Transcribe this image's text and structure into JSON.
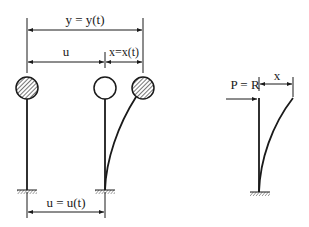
{
  "diagram": {
    "labels": {
      "total_displacement": "y = y(t)",
      "ground_distance": "u",
      "relative_displacement": "x=x(t)",
      "ground_displacement": "u = u(t)",
      "force": "P = R",
      "static_deflection": "x"
    },
    "elements": {
      "left_mass": "hatched-mass",
      "middle_mass": "empty-mass",
      "right_mass": "hatched-mass-deflected",
      "right_figure": "static-cantilever-under-load"
    },
    "colors": {
      "line": "#1a1a1a",
      "background": "#ffffff"
    }
  }
}
